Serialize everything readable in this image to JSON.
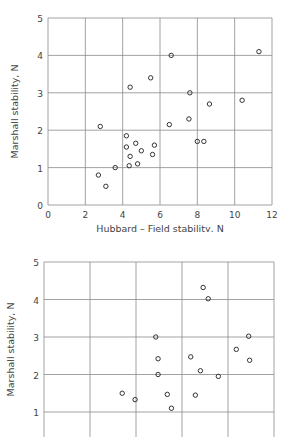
{
  "chart_data": [
    {
      "type": "scatter",
      "title": "",
      "xlabel": "Hubbard – Field stability,  N",
      "ylabel": "Marshall stability,  N",
      "xlim": [
        0,
        12
      ],
      "ylim": [
        0,
        5
      ],
      "xticks": [
        0,
        2,
        4,
        6,
        8,
        10,
        12
      ],
      "yticks": [
        0,
        1,
        2,
        3,
        4,
        5
      ],
      "grid": true,
      "marker": "open-circle",
      "points": [
        {
          "x": 2.7,
          "y": 0.8
        },
        {
          "x": 3.1,
          "y": 0.5
        },
        {
          "x": 2.8,
          "y": 2.1
        },
        {
          "x": 3.6,
          "y": 1.0
        },
        {
          "x": 4.2,
          "y": 1.85
        },
        {
          "x": 4.2,
          "y": 1.55
        },
        {
          "x": 4.4,
          "y": 3.15
        },
        {
          "x": 4.4,
          "y": 1.3
        },
        {
          "x": 4.35,
          "y": 1.05
        },
        {
          "x": 4.7,
          "y": 1.65
        },
        {
          "x": 4.8,
          "y": 1.1
        },
        {
          "x": 5.0,
          "y": 1.45
        },
        {
          "x": 5.5,
          "y": 3.4
        },
        {
          "x": 5.6,
          "y": 1.35
        },
        {
          "x": 5.7,
          "y": 1.6
        },
        {
          "x": 6.5,
          "y": 2.15
        },
        {
          "x": 6.6,
          "y": 4.0
        },
        {
          "x": 7.6,
          "y": 3.0
        },
        {
          "x": 7.55,
          "y": 2.3
        },
        {
          "x": 8.0,
          "y": 1.7
        },
        {
          "x": 8.35,
          "y": 1.7
        },
        {
          "x": 8.65,
          "y": 2.7
        },
        {
          "x": 10.4,
          "y": 2.8
        },
        {
          "x": 11.3,
          "y": 4.1
        }
      ]
    },
    {
      "type": "scatter",
      "title": "",
      "xlabel": "",
      "ylabel": "Marshall stability,  N",
      "xlim": [
        0,
        5
      ],
      "ylim": [
        0.6,
        5
      ],
      "xticks": [],
      "yticks": [
        1,
        2,
        3,
        4,
        5
      ],
      "grid": true,
      "marker": "open-circle",
      "x_units": "grid columns (x-axis labels not visible)",
      "points": [
        {
          "x": 1.7,
          "y": 1.5
        },
        {
          "x": 1.98,
          "y": 1.33
        },
        {
          "x": 2.43,
          "y": 3.0
        },
        {
          "x": 2.48,
          "y": 2.42
        },
        {
          "x": 2.48,
          "y": 2.0
        },
        {
          "x": 2.68,
          "y": 1.47
        },
        {
          "x": 2.77,
          "y": 1.1
        },
        {
          "x": 3.19,
          "y": 2.47
        },
        {
          "x": 3.29,
          "y": 1.45
        },
        {
          "x": 3.4,
          "y": 2.1
        },
        {
          "x": 3.46,
          "y": 4.32
        },
        {
          "x": 3.57,
          "y": 4.02
        },
        {
          "x": 3.79,
          "y": 1.95
        },
        {
          "x": 4.18,
          "y": 2.67
        },
        {
          "x": 4.45,
          "y": 3.02
        },
        {
          "x": 4.47,
          "y": 2.38
        }
      ]
    }
  ]
}
